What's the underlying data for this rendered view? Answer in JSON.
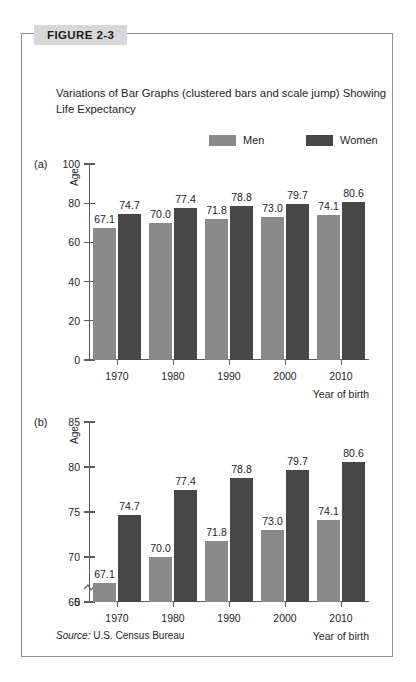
{
  "figure": {
    "tag": "FIGURE 2-3",
    "title": "Variations of Bar Graphs (clustered bars and scale jump) Showing Life Expectancy",
    "source_prefix": "Source:",
    "source_text": "U.S. Census Bureau"
  },
  "legend": {
    "men_label": "Men",
    "women_label": "Women",
    "men_color": "#8a8a8a",
    "women_color": "#474747"
  },
  "panels": {
    "a_label": "(a)",
    "b_label": "(b)"
  },
  "chart_data": [
    {
      "type": "bar",
      "id": "panel-a",
      "title": "",
      "panel": "(a)",
      "categories": [
        "1970",
        "1980",
        "1990",
        "2000",
        "2010"
      ],
      "series": [
        {
          "name": "Men",
          "values": [
            67.1,
            70.0,
            71.8,
            73.0,
            74.1
          ],
          "color": "#8a8a8a"
        },
        {
          "name": "Women",
          "values": [
            74.7,
            77.4,
            78.8,
            79.7,
            80.6
          ],
          "color": "#474747"
        }
      ],
      "xlabel": "Year of birth",
      "ylabel": "Age",
      "ylim": [
        0,
        100
      ],
      "yticks": [
        0,
        20,
        40,
        60,
        80,
        100
      ],
      "grid": false,
      "scale_break": false,
      "legend_position": "top"
    },
    {
      "type": "bar",
      "id": "panel-b",
      "title": "",
      "panel": "(b)",
      "categories": [
        "1970",
        "1980",
        "1990",
        "2000",
        "2010"
      ],
      "series": [
        {
          "name": "Men",
          "values": [
            67.1,
            70.0,
            71.8,
            73.0,
            74.1
          ],
          "color": "#8a8a8a"
        },
        {
          "name": "Women",
          "values": [
            74.7,
            77.4,
            78.8,
            79.7,
            80.6
          ],
          "color": "#474747"
        }
      ],
      "xlabel": "Year of birth",
      "ylabel": "Age",
      "ylim": [
        65,
        85
      ],
      "yticks": [
        65,
        70,
        75,
        80,
        85
      ],
      "zero_tick": "0",
      "grid": false,
      "scale_break": true,
      "legend_position": "top"
    }
  ]
}
